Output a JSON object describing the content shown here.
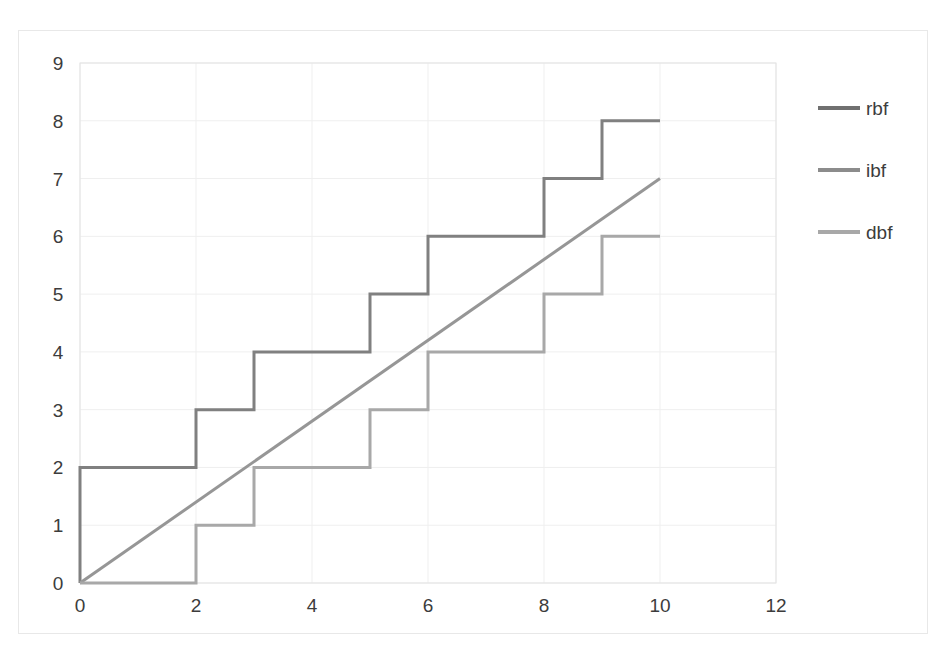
{
  "chart_data": {
    "type": "line",
    "title": "",
    "xlabel": "",
    "ylabel": "",
    "xlim": [
      0,
      12
    ],
    "ylim": [
      0,
      9
    ],
    "xticks": [
      0,
      2,
      4,
      6,
      8,
      10,
      12
    ],
    "yticks": [
      0,
      1,
      2,
      3,
      4,
      5,
      6,
      7,
      8,
      9
    ],
    "xtick_labels": [
      "0",
      "2",
      "4",
      "6",
      "8",
      "10",
      "12"
    ],
    "ytick_labels": [
      "0",
      "1",
      "2",
      "3",
      "4",
      "5",
      "6",
      "7",
      "8",
      "9"
    ],
    "grid": true,
    "legend_position": "right",
    "series": [
      {
        "name": "rbf",
        "color": "#808080",
        "linewidth": 3,
        "style": "step",
        "x": [
          0,
          0,
          2,
          2,
          3,
          3,
          5,
          5,
          6,
          6,
          8,
          8,
          9,
          9,
          10
        ],
        "y": [
          0,
          2,
          2,
          3,
          3,
          4,
          4,
          5,
          5,
          6,
          6,
          7,
          7,
          8,
          8
        ]
      },
      {
        "name": "ibf",
        "color": "#969696",
        "linewidth": 3,
        "style": "linear",
        "x": [
          0,
          10
        ],
        "y": [
          0,
          7
        ]
      },
      {
        "name": "dbf",
        "color": "#a8a8a8",
        "linewidth": 3,
        "style": "step",
        "x": [
          0,
          2,
          2,
          3,
          3,
          5,
          5,
          6,
          6,
          8,
          8,
          9,
          9,
          10
        ],
        "y": [
          0,
          0,
          1,
          1,
          2,
          2,
          3,
          3,
          4,
          4,
          5,
          5,
          6,
          6
        ]
      }
    ]
  },
  "legend": {
    "entries": [
      {
        "label": "rbf",
        "color": "#707070"
      },
      {
        "label": "ibf",
        "color": "#8c8c8c"
      },
      {
        "label": "dbf",
        "color": "#a8a8a8"
      }
    ]
  },
  "colors": {
    "gridline": "#efefef",
    "plot_border": "#e3e3e3",
    "figure_border": "#e8e8e8",
    "tick_text": "#3c3c3c",
    "background": "#ffffff"
  }
}
